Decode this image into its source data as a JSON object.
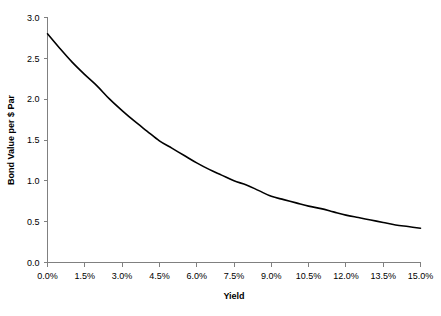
{
  "chart_data": {
    "type": "line",
    "title": "",
    "xlabel": "Yield",
    "ylabel": "Bond Value per $ Par",
    "xlim": [
      0,
      15
    ],
    "ylim": [
      0,
      3
    ],
    "grid": false,
    "legend": null,
    "x_tick_labels": [
      "0.0%",
      "1.5%",
      "3.0%",
      "4.5%",
      "6.0%",
      "7.5%",
      "9.0%",
      "10.5%",
      "12.0%",
      "13.5%",
      "15.0%"
    ],
    "x_tick_values": [
      0,
      1.5,
      3,
      4.5,
      6,
      7.5,
      9,
      10.5,
      12,
      13.5,
      15
    ],
    "y_tick_labels": [
      "0.0",
      "0.5",
      "1.0",
      "1.5",
      "2.0",
      "2.5",
      "3.0"
    ],
    "y_tick_values": [
      0,
      0.5,
      1,
      1.5,
      2,
      2.5,
      3
    ],
    "series": [
      {
        "name": "Bond Value",
        "color": "#000000",
        "x": [
          0,
          0.5,
          1,
          1.5,
          2,
          2.5,
          3,
          3.5,
          4,
          4.5,
          5,
          5.5,
          6,
          6.5,
          7,
          7.5,
          8,
          8.5,
          9,
          9.5,
          10,
          10.5,
          11,
          11.5,
          12,
          12.5,
          13,
          13.5,
          14,
          14.5,
          15
        ],
        "values": [
          2.8,
          2.62,
          2.45,
          2.3,
          2.16,
          2.0,
          1.86,
          1.73,
          1.61,
          1.49,
          1.4,
          1.31,
          1.22,
          1.14,
          1.07,
          1.0,
          0.95,
          0.88,
          0.81,
          0.77,
          0.73,
          0.69,
          0.66,
          0.62,
          0.58,
          0.55,
          0.52,
          0.49,
          0.46,
          0.44,
          0.42
        ]
      }
    ]
  }
}
